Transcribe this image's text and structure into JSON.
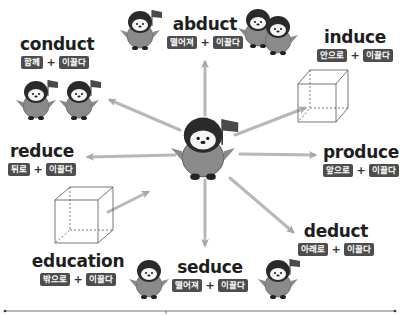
{
  "center": {
    "label": "penguin-with-flag"
  },
  "words": [
    {
      "id": "conduct",
      "title": "conduct",
      "prefix": "함께",
      "root": "이끌다",
      "plus": "+"
    },
    {
      "id": "abduct",
      "title": "abduct",
      "prefix": "떨어져",
      "root": "이끌다",
      "plus": "+"
    },
    {
      "id": "induce",
      "title": "induce",
      "prefix": "안으로",
      "root": "이끌다",
      "plus": "+"
    },
    {
      "id": "reduce",
      "title": "reduce",
      "prefix": "뒤로",
      "root": "이끌다",
      "plus": "+"
    },
    {
      "id": "produce",
      "title": "produce",
      "prefix": "앞으로",
      "root": "이끌다",
      "plus": "+"
    },
    {
      "id": "education",
      "title": "education",
      "prefix": "밖으로",
      "root": "이끌다",
      "plus": "+"
    },
    {
      "id": "seduce",
      "title": "seduce",
      "prefix": "떨어져",
      "root": "이끌다",
      "plus": "+"
    },
    {
      "id": "deduct",
      "title": "deduct",
      "prefix": "아래로",
      "root": "이끌다",
      "plus": "+"
    }
  ],
  "colors": {
    "tag_bg": "#4d4d4d",
    "arrow": "#b8b8b8",
    "penguin_body": "#8a8a8a",
    "penguin_head": "#2a2a2a"
  }
}
